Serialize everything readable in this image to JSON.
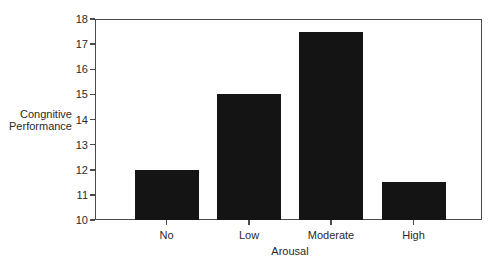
{
  "chart_data": {
    "type": "bar",
    "title": "",
    "xlabel": "Arousal",
    "ylabel": "Congnitive Performance",
    "ylabel_lines": [
      "Congnitive",
      "Performance"
    ],
    "categories": [
      "No",
      "Low",
      "Moderate",
      "High"
    ],
    "values": [
      12,
      15,
      17.5,
      11.5
    ],
    "ylim": [
      10,
      18
    ],
    "yticks": [
      10,
      11,
      12,
      13,
      14,
      15,
      16,
      17,
      18
    ],
    "grid": false,
    "legend": null,
    "bar_color": "#141414"
  }
}
